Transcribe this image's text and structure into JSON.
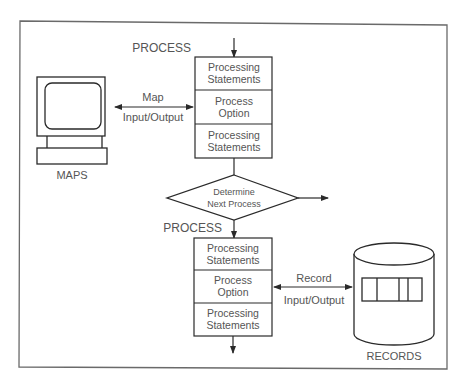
{
  "diagram": {
    "colors": {
      "stroke": "#2a2a2a",
      "text": "#555555",
      "frame": "#6a6a6a",
      "background": "#ffffff"
    },
    "top_process": {
      "label": "PROCESS",
      "sections": [
        {
          "line1": "Processing",
          "line2": "Statements"
        },
        {
          "line1": "Process",
          "line2": "Option"
        },
        {
          "line1": "Processing",
          "line2": "Statements"
        }
      ]
    },
    "maps": {
      "label": "MAPS",
      "connector": {
        "line1": "Map",
        "line2": "Input/Output"
      },
      "icon": "monitor-icon"
    },
    "decision": {
      "line1": "Determine",
      "line2": "Next Process"
    },
    "bottom_process": {
      "label": "PROCESS",
      "sections": [
        {
          "line1": "Processing",
          "line2": "Statements"
        },
        {
          "line1": "Process",
          "line2": "Option"
        },
        {
          "line1": "Processing",
          "line2": "Statements"
        }
      ]
    },
    "records": {
      "label": "RECORDS",
      "connector": {
        "line1": "Record",
        "line2": "Input/Output"
      },
      "icon": "database-cylinder-icon"
    }
  }
}
